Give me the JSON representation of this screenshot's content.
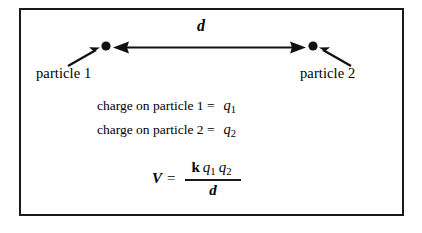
{
  "figure": {
    "kind": "physics-diagram",
    "topic": "electric potential energy of two point charges",
    "border_color": "#1a1a1a",
    "background_color": "#ffffff",
    "ink_color": "#000000"
  },
  "particles": [
    {
      "id": "particle-1",
      "label": "particle 1",
      "dot_x": 106,
      "dot_y": 47,
      "pointer_from_x": 70,
      "pointer_from_y": 66,
      "charge_symbol": "q",
      "charge_subscript": "1"
    },
    {
      "id": "particle-2",
      "label": "particle 2",
      "dot_x": 313,
      "dot_y": 47,
      "pointer_from_x": 349,
      "pointer_from_y": 66,
      "charge_symbol": "q",
      "charge_subscript": "2"
    }
  ],
  "separation": {
    "label": "d",
    "arrow_left_x": 113,
    "arrow_right_x": 306,
    "arrow_y": 47
  },
  "charge_lines": [
    {
      "text": "charge on particle 1 =",
      "symbol": "q",
      "subscript": "1"
    },
    {
      "text": "charge on particle 2 =",
      "symbol": "q",
      "subscript": "2"
    }
  ],
  "equation": {
    "lhs": "V",
    "equals": "=",
    "numerator": {
      "constant": "k",
      "terms": [
        {
          "symbol": "q",
          "subscript": "1"
        },
        {
          "symbol": "q",
          "subscript": "2"
        }
      ]
    },
    "denominator": "d",
    "plain_text": "V = k q1 q2 / d"
  }
}
